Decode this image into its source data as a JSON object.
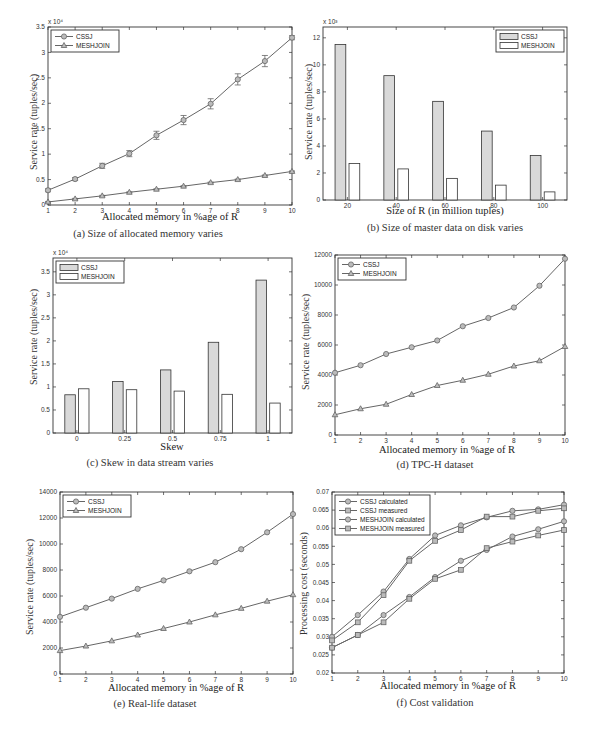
{
  "figure": {
    "panels": [
      {
        "id": "a",
        "caption": "(a) Size of allocated memory varies",
        "xlabel": "Allocated memory in %age of R",
        "ylabel": "Service rate (tuples/sec)",
        "multiplier": "x 10⁴"
      },
      {
        "id": "b",
        "caption": "(b) Size of master data on disk varies",
        "xlabel": "Size of R (in million tuples)",
        "ylabel": "Service rate (tuples/sec)",
        "multiplier": "x 10³"
      },
      {
        "id": "c",
        "caption": "(c) Skew in data stream varies",
        "xlabel": "Skew",
        "ylabel": "Service rate (tuples/sec)",
        "multiplier": "x 10⁴"
      },
      {
        "id": "d",
        "caption": "(d) TPC-H dataset",
        "xlabel": "Allocated memory in %age of R",
        "ylabel": "Service rate (tuples/sec)",
        "multiplier": ""
      },
      {
        "id": "e",
        "caption": "(e) Real-life dataset",
        "xlabel": "Allocated memory in %age of R",
        "ylabel": "Service rate (tuples/sec)",
        "multiplier": ""
      },
      {
        "id": "f",
        "caption": "(f) Cost validation",
        "xlabel": "Allocated memory in %age of R",
        "ylabel": "Processing cost (seconds)",
        "multiplier": ""
      }
    ]
  },
  "chart_data": [
    {
      "id": "a",
      "type": "line",
      "title": "(a) Size of allocated memory varies",
      "xlabel": "Allocated memory in %age of R",
      "ylabel": "Service rate (tuples/sec)",
      "y_multiplier": "x 10^4",
      "x": [
        1,
        2,
        3,
        4,
        5,
        6,
        7,
        8,
        9,
        10
      ],
      "xlim": [
        1,
        10
      ],
      "ylim": [
        0,
        3.5
      ],
      "yticks": [
        0,
        0.5,
        1,
        1.5,
        2,
        2.5,
        3,
        3.5
      ],
      "xticks": [
        1,
        2,
        3,
        4,
        5,
        6,
        7,
        8,
        9,
        10
      ],
      "legend_position": "upper left",
      "error_bars": true,
      "series": [
        {
          "name": "CSSJ",
          "marker": "circle",
          "values": [
            0.29,
            0.51,
            0.77,
            1.01,
            1.37,
            1.67,
            1.99,
            2.47,
            2.83,
            3.29
          ],
          "errors": [
            0.03,
            0.03,
            0.05,
            0.06,
            0.08,
            0.09,
            0.1,
            0.11,
            0.11,
            0.04
          ]
        },
        {
          "name": "MESHJOIN",
          "marker": "triangle",
          "values": [
            0.06,
            0.12,
            0.18,
            0.25,
            0.31,
            0.37,
            0.44,
            0.5,
            0.58,
            0.66
          ],
          "errors": [
            0.01,
            0.01,
            0.01,
            0.01,
            0.01,
            0.01,
            0.01,
            0.01,
            0.01,
            0.01
          ]
        }
      ]
    },
    {
      "id": "b",
      "type": "bar",
      "title": "(b) Size of master data on disk varies",
      "xlabel": "Size of R (in million tuples)",
      "ylabel": "Service rate (tuples/sec)",
      "y_multiplier": "x 10^3",
      "categories": [
        "20",
        "40",
        "60",
        "80",
        "100"
      ],
      "ylim": [
        0,
        12.8
      ],
      "yticks": [
        0,
        2,
        4,
        6,
        8,
        10,
        12
      ],
      "legend_position": "upper right",
      "series": [
        {
          "name": "CSSJ",
          "fill": "#d9d9d9",
          "values": [
            11.5,
            9.2,
            7.3,
            5.1,
            3.3
          ]
        },
        {
          "name": "MESHJOIN",
          "fill": "#ffffff",
          "values": [
            2.7,
            2.3,
            1.6,
            1.1,
            0.6
          ]
        }
      ]
    },
    {
      "id": "c",
      "type": "bar",
      "title": "(c) Skew in data stream varies",
      "xlabel": "Skew",
      "ylabel": "Service rate (tuples/sec)",
      "y_multiplier": "x 10^4",
      "categories": [
        "0",
        "0.25",
        "0.5",
        "0.75",
        "1"
      ],
      "ylim": [
        0,
        3.8
      ],
      "yticks": [
        0,
        0.5,
        1,
        1.5,
        2,
        2.5,
        3,
        3.5
      ],
      "legend_position": "upper left",
      "series": [
        {
          "name": "CSSJ",
          "fill": "#d9d9d9",
          "values": [
            0.83,
            1.12,
            1.37,
            1.97,
            3.32
          ]
        },
        {
          "name": "MESHJOIN",
          "fill": "#ffffff",
          "values": [
            0.96,
            0.94,
            0.91,
            0.84,
            0.65
          ]
        }
      ]
    },
    {
      "id": "d",
      "type": "line",
      "title": "(d) TPC-H dataset",
      "xlabel": "Allocated memory in %age of R",
      "ylabel": "Service rate (tuples/sec)",
      "x": [
        1,
        2,
        3,
        4,
        5,
        6,
        7,
        8,
        9,
        10
      ],
      "xlim": [
        1,
        10
      ],
      "ylim": [
        0,
        12000
      ],
      "yticks": [
        0,
        2000,
        4000,
        6000,
        8000,
        10000,
        12000
      ],
      "xticks": [
        1,
        2,
        3,
        4,
        5,
        6,
        7,
        8,
        9,
        10
      ],
      "legend_position": "upper left",
      "series": [
        {
          "name": "CSSJ",
          "marker": "circle",
          "values": [
            4150,
            4650,
            5400,
            5850,
            6300,
            7250,
            7800,
            8500,
            9950,
            11750
          ]
        },
        {
          "name": "MESHJOIN",
          "marker": "triangle",
          "values": [
            1350,
            1750,
            2050,
            2700,
            3300,
            3650,
            4050,
            4600,
            4950,
            5900
          ]
        }
      ]
    },
    {
      "id": "e",
      "type": "line",
      "title": "(e) Real-life dataset",
      "xlabel": "Allocated memory in %age of R",
      "ylabel": "Service rate (tuples/sec)",
      "x": [
        1,
        2,
        3,
        4,
        5,
        6,
        7,
        8,
        9,
        10
      ],
      "xlim": [
        1,
        10
      ],
      "ylim": [
        0,
        14000
      ],
      "yticks": [
        0,
        2000,
        4000,
        6000,
        8000,
        10000,
        12000,
        14000
      ],
      "xticks": [
        1,
        2,
        3,
        4,
        5,
        6,
        7,
        8,
        9,
        10
      ],
      "legend_position": "upper left",
      "series": [
        {
          "name": "CSSJ",
          "marker": "circle",
          "values": [
            4400,
            5100,
            5800,
            6550,
            7200,
            7900,
            8600,
            9600,
            10900,
            12300
          ]
        },
        {
          "name": "MESHJOIN",
          "marker": "triangle",
          "values": [
            1800,
            2150,
            2550,
            3000,
            3500,
            4000,
            4550,
            5050,
            5600,
            6100
          ]
        }
      ]
    },
    {
      "id": "f",
      "type": "line",
      "title": "(f) Cost validation",
      "xlabel": "Allocated memory in %age of R",
      "ylabel": "Processing cost (seconds)",
      "x": [
        1,
        2,
        3,
        4,
        5,
        6,
        7,
        8,
        9,
        10
      ],
      "xlim": [
        1,
        10
      ],
      "ylim": [
        0.02,
        0.07
      ],
      "yticks": [
        0.02,
        0.025,
        0.03,
        0.035,
        0.04,
        0.045,
        0.05,
        0.055,
        0.06,
        0.065,
        0.07
      ],
      "xticks": [
        1,
        2,
        3,
        4,
        5,
        6,
        7,
        8,
        9,
        10
      ],
      "legend_position": "upper left",
      "series": [
        {
          "name": "CSSJ calculated",
          "marker": "circle",
          "values": [
            0.03,
            0.036,
            0.0425,
            0.0515,
            0.058,
            0.0608,
            0.063,
            0.0648,
            0.0652,
            0.0665
          ]
        },
        {
          "name": "CSSJ measured",
          "marker": "square",
          "values": [
            0.029,
            0.034,
            0.0415,
            0.051,
            0.0565,
            0.0595,
            0.0632,
            0.0632,
            0.0648,
            0.0655
          ]
        },
        {
          "name": "MESHJOIN calculated",
          "marker": "circle",
          "values": [
            0.027,
            0.0305,
            0.036,
            0.041,
            0.0465,
            0.051,
            0.054,
            0.0577,
            0.0597,
            0.0619
          ]
        },
        {
          "name": "MESHJOIN measured",
          "marker": "square",
          "values": [
            0.027,
            0.0305,
            0.034,
            0.0405,
            0.046,
            0.0485,
            0.0545,
            0.0563,
            0.058,
            0.0595
          ]
        }
      ]
    }
  ],
  "style": {
    "axis_color": "#333333",
    "line_color": "#666666",
    "bar_primary_fill": "#d9d9d9",
    "bar_secondary_fill": "#ffffff"
  }
}
